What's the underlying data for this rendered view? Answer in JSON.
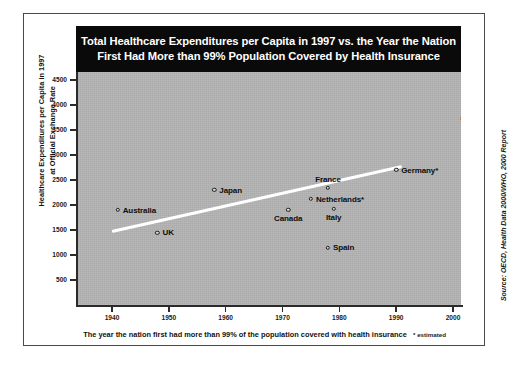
{
  "chart_data": {
    "type": "scatter",
    "title": "Total Healthcare Expenditures per Capita in 1997 vs. the Year the Nation First Had More than 99% Population Covered by Health Insurance",
    "title_line1": "Total Healthcare Expenditures per Capita in 1997 vs. the Year the Nation",
    "title_line2": "First Had More than 99% Population Covered by Health Insurance",
    "xlabel": "The year the nation first had more than 99% of the population covered with health insurance",
    "ylabel": "Healthcare Expenditures per Capita in 1997 at Official Exchange Rate",
    "footnote": "* estimated",
    "source": "Source: OECD, Health Data 2000/WHO, 2000 Report",
    "xlim": [
      1935,
      2006
    ],
    "ylim": [
      0,
      4500
    ],
    "yticks": [
      500,
      1000,
      1500,
      2000,
      2500,
      3000,
      3500,
      4000,
      4500
    ],
    "ytick_labels": [
      "500",
      "1000",
      "1500",
      "2000",
      "2500",
      "3000",
      "3500",
      "4000",
      "4500"
    ],
    "xticks": [
      1940,
      1950,
      1960,
      1970,
      1980,
      1990,
      2000
    ],
    "xtick_labels": [
      "1940",
      "1950",
      "1960",
      "1970",
      "1980",
      "1990",
      "2000"
    ],
    "grid": false,
    "legend": "none",
    "marker": "open-circle",
    "plot_background": "#b4b4b4",
    "trendline": {
      "label": "trend-line",
      "color": "#ffffff",
      "x_start": 1940,
      "y_start": 1460,
      "x_end": 1991,
      "y_end": 2760
    },
    "points": [
      {
        "name": "Australia",
        "x": 1941,
        "y": 1900,
        "label": "Australia",
        "label_pos": "right"
      },
      {
        "name": "UK",
        "x": 1948,
        "y": 1450,
        "label": "UK",
        "label_pos": "right"
      },
      {
        "name": "Japan",
        "x": 1958,
        "y": 2300,
        "label": "Japan",
        "label_pos": "right"
      },
      {
        "name": "Canada",
        "x": 1971,
        "y": 1900,
        "label": "Canada",
        "label_pos": "below"
      },
      {
        "name": "Netherlands",
        "x": 1975,
        "y": 2120,
        "label": "Netherlands*",
        "label_pos": "right"
      },
      {
        "name": "France",
        "x": 1978,
        "y": 2350,
        "label": "France",
        "label_pos": "above"
      },
      {
        "name": "Spain",
        "x": 1978,
        "y": 1150,
        "label": "Spain",
        "label_pos": "right"
      },
      {
        "name": "Italy",
        "x": 1979,
        "y": 1920,
        "label": "Italy",
        "label_pos": "below"
      },
      {
        "name": "Germany",
        "x": 1990,
        "y": 2700,
        "label": "Germany*",
        "label_pos": "right"
      },
      {
        "name": "United States",
        "x": 2003,
        "y": 4080,
        "label": "U.S.*",
        "sublabel": "(2006)",
        "label_pos": "below"
      }
    ]
  }
}
